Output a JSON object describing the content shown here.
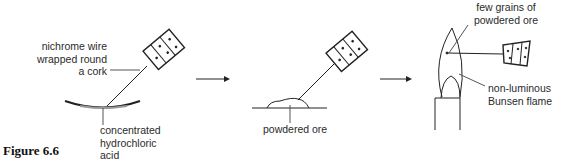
{
  "figure": {
    "caption": "Figure 6.6"
  },
  "panel1": {
    "label_wire": [
      "nichrome wire",
      "wrapped round",
      "a cork"
    ],
    "label_acid": [
      "concentrated",
      "hydrochloric",
      "acid"
    ]
  },
  "panel2": {
    "label_ore": "powdered ore"
  },
  "panel3": {
    "label_grains": [
      "few grains of",
      "powdered ore"
    ],
    "label_flame": [
      "non-luminous",
      "Bunsen flame"
    ]
  },
  "arrows": 2
}
